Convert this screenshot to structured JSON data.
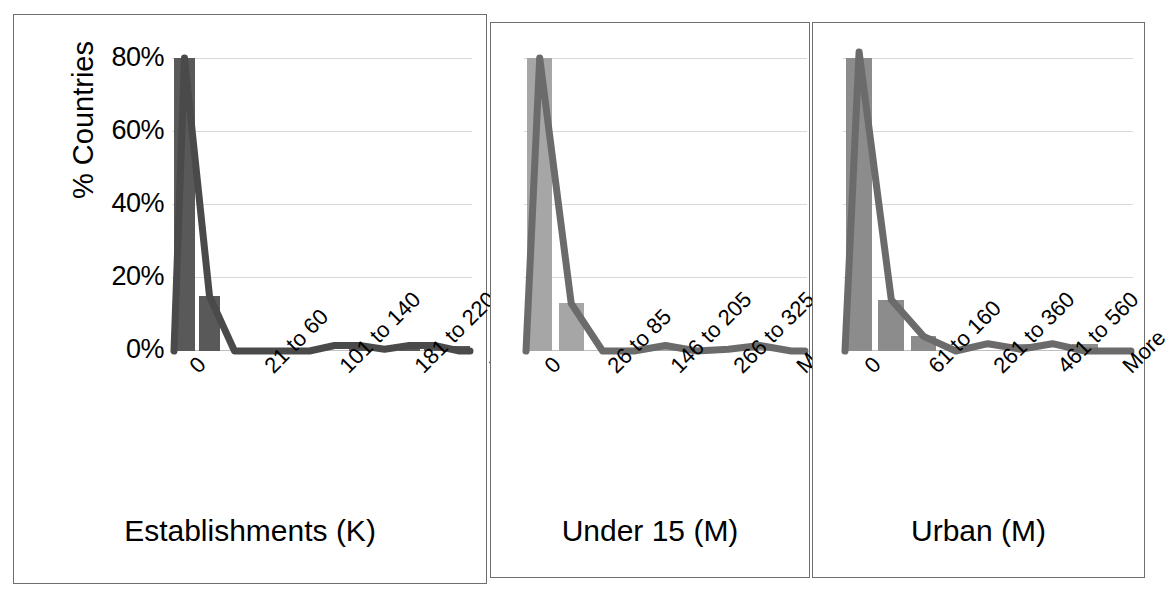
{
  "figure": {
    "yaxis_label": "% Countries",
    "yticks": [
      "80%",
      "60%",
      "40%",
      "20%",
      "0%"
    ],
    "ylim": [
      0,
      80
    ]
  },
  "colors": {
    "panel_border": "#6e6e6e",
    "gridline": "#d9d9d9",
    "bar_dark": "#595959",
    "bar_light": "#a6a6a6",
    "bar_medium": "#8c8c8c",
    "line_dark": "#4a4a4a",
    "line_mid": "#6b6b6b",
    "text": "#000000"
  },
  "chart_data": [
    {
      "type": "bar",
      "title": "Establishments (K)",
      "xlabel": "Establishments (K)",
      "ylabel": "% Countries",
      "ylim": [
        0,
        80
      ],
      "grid": true,
      "tick_labels": [
        "0",
        "21 to 60",
        "101 to 140",
        "181 to 220",
        "More"
      ],
      "categories": [
        "0",
        "21 to 60",
        "41 to 80",
        "61 to 100",
        "81 to 120",
        "101 to 140",
        "121 to 160",
        "141 to 180",
        "161 to 200",
        "181 to 220",
        "201 to 240",
        "More"
      ],
      "values": [
        80,
        15,
        0,
        0,
        0,
        0,
        0,
        1.5,
        1.5,
        0.5,
        1.5,
        1.5
      ],
      "series": [
        {
          "name": "Frequency",
          "values": [
            80,
            15,
            0,
            0,
            0,
            0,
            0,
            1.5,
            1.5,
            0.5,
            1.5,
            1.5
          ]
        },
        {
          "name": "Cumulative line",
          "values": [
            0,
            80,
            15,
            0,
            0,
            0,
            0,
            1.5,
            1.5,
            0.5,
            1.5,
            1.5,
            0
          ]
        }
      ]
    },
    {
      "type": "bar",
      "title": "Under 15 (M)",
      "xlabel": "Under 15 (M)",
      "ylabel": "% Countries",
      "ylim": [
        0,
        80
      ],
      "grid": true,
      "tick_labels": [
        "0",
        "26 to 85",
        "146 to 205",
        "266 to 325",
        "More"
      ],
      "categories": [
        "0",
        "26 to 85",
        "86 to 145",
        "146 to 205",
        "206 to 265",
        "266 to 325",
        "326 to 385",
        "386 to 445",
        "More"
      ],
      "values": [
        80,
        13,
        0,
        0,
        1.5,
        0,
        0.5,
        1.5,
        0
      ],
      "series": [
        {
          "name": "Frequency",
          "values": [
            80,
            13,
            0,
            0,
            1.5,
            0,
            0.5,
            1.5,
            0
          ]
        },
        {
          "name": "Cumulative line",
          "values": [
            0,
            80,
            13,
            0,
            0,
            1.5,
            0,
            0.5,
            1.5,
            0
          ]
        }
      ]
    },
    {
      "type": "bar",
      "title": "Urban (M)",
      "xlabel": "Urban (M)",
      "ylabel": "% Countries",
      "ylim": [
        0,
        80
      ],
      "grid": true,
      "tick_labels": [
        "0",
        "61 to 160",
        "261 to 360",
        "461 to 560",
        "More"
      ],
      "categories": [
        "0",
        "61 to 160",
        "161 to 260",
        "261 to 360",
        "361 to 460",
        "461 to 560",
        "561 to 660",
        "661 to 760",
        "More"
      ],
      "values": [
        80,
        14,
        4,
        0,
        0,
        2,
        0,
        2,
        0
      ],
      "series": [
        {
          "name": "Frequency",
          "values": [
            80,
            14,
            4,
            0,
            0,
            2,
            0,
            2,
            0
          ]
        },
        {
          "name": "Cumulative line",
          "values": [
            0,
            82,
            14,
            4,
            0,
            2,
            0.5,
            2,
            0
          ]
        }
      ]
    }
  ]
}
